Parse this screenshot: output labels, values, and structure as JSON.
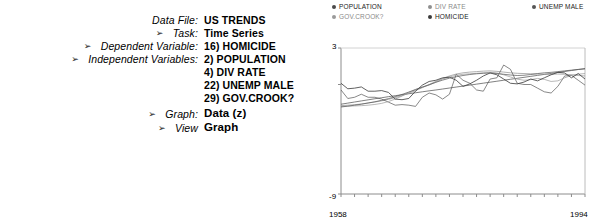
{
  "form": {
    "rows": [
      {
        "arrow": false,
        "label": "Data File:",
        "value": "US TRENDS",
        "big": false
      },
      {
        "arrow": true,
        "label": "Task:",
        "value": "Time Series",
        "big": false
      },
      {
        "arrow": true,
        "label": "Dependent Variable:",
        "value": "16) HOMICIDE",
        "big": false
      },
      {
        "arrow": true,
        "label": "Independent Variables:",
        "value": "2) POPULATION",
        "big": false
      },
      {
        "arrow": false,
        "label": "",
        "value": "4) DIV RATE",
        "big": false
      },
      {
        "arrow": false,
        "label": "",
        "value": "22) UNEMP MALE",
        "big": false
      },
      {
        "arrow": false,
        "label": "",
        "value": "29) GOV.CROOK?",
        "big": false
      },
      {
        "arrow": true,
        "label": "Graph:",
        "value": "Data (z)",
        "big": true
      },
      {
        "arrow": true,
        "label": "View",
        "value": "Graph",
        "big": true
      }
    ],
    "arrow_glyph": "➢"
  },
  "chart_data": {
    "type": "line",
    "title": "",
    "xlabel": "",
    "ylabel": "",
    "xlim": [
      1958,
      1994
    ],
    "ylim": [
      -9,
      3
    ],
    "ytick_labels": [
      "3",
      "-9"
    ],
    "xtick_labels": [
      "1958",
      "1994"
    ],
    "grid": false,
    "legend_position": "top",
    "legend": [
      {
        "name": "POPULATION",
        "color": "#4a4a4a",
        "col": 0,
        "row": 0
      },
      {
        "name": "GOV.CROOK?",
        "color": "#9a9a9a",
        "col": 0,
        "row": 1
      },
      {
        "name": "DIV RATE",
        "color": "#8f8f8f",
        "col": 1,
        "row": 0
      },
      {
        "name": "HOMICIDE",
        "color": "#3a3a3a",
        "col": 1,
        "row": 1
      },
      {
        "name": "UNEMP MALE",
        "color": "#555555",
        "col": 2,
        "row": 0
      }
    ],
    "x": [
      1958,
      1959,
      1960,
      1961,
      1962,
      1963,
      1964,
      1965,
      1966,
      1967,
      1968,
      1969,
      1970,
      1971,
      1972,
      1973,
      1974,
      1975,
      1976,
      1977,
      1978,
      1979,
      1980,
      1981,
      1982,
      1983,
      1984,
      1985,
      1986,
      1987,
      1988,
      1989,
      1990,
      1991,
      1992,
      1993,
      1994
    ],
    "series": [
      {
        "name": "POPULATION",
        "color": "#4a4a4a",
        "width": 0.7,
        "values": [
          -1.62,
          -1.53,
          -1.44,
          -1.35,
          -1.26,
          -1.17,
          -1.09,
          -1.0,
          -0.92,
          -0.84,
          -0.76,
          -0.68,
          -0.6,
          -0.52,
          -0.45,
          -0.37,
          -0.29,
          -0.21,
          -0.13,
          -0.05,
          0.03,
          0.11,
          0.19,
          0.27,
          0.35,
          0.43,
          0.51,
          0.59,
          0.67,
          0.75,
          0.83,
          0.91,
          0.99,
          1.07,
          1.15,
          1.23,
          1.31
        ]
      },
      {
        "name": "DIV RATE",
        "color": "#8f8f8f",
        "width": 0.7,
        "values": [
          -1.74,
          -1.7,
          -1.66,
          -1.6,
          -1.52,
          -1.44,
          -1.34,
          -1.22,
          -1.08,
          -0.92,
          -0.72,
          -0.5,
          -0.26,
          0.0,
          0.26,
          0.5,
          0.7,
          0.86,
          0.96,
          1.02,
          1.06,
          1.1,
          1.12,
          1.08,
          1.02,
          0.96,
          0.92,
          0.9,
          0.88,
          0.86,
          0.84,
          0.84,
          0.86,
          0.84,
          0.8,
          0.74,
          0.7
        ]
      },
      {
        "name": "UNEMP MALE",
        "color": "#555555",
        "width": 0.7,
        "values": [
          -0.45,
          -1.15,
          -1.05,
          -0.8,
          -1.05,
          -1.05,
          -1.2,
          -1.45,
          -1.7,
          -1.65,
          -1.7,
          -1.8,
          -1.05,
          -0.7,
          -0.85,
          -1.2,
          -0.8,
          0.85,
          0.35,
          0.1,
          -0.45,
          -0.55,
          0.45,
          0.55,
          1.6,
          1.25,
          0.1,
          0.0,
          0.0,
          -0.3,
          -0.6,
          -0.7,
          -0.15,
          0.7,
          0.75,
          0.35,
          -0.05
        ]
      },
      {
        "name": "GOV.CROOK?",
        "color": "#9a9a9a",
        "width": 0.7,
        "values": [
          -1.8,
          -1.78,
          -1.76,
          -1.74,
          -1.7,
          -1.64,
          -1.55,
          -1.4,
          -1.2,
          -0.95,
          -0.66,
          -0.4,
          -0.2,
          -0.05,
          0.2,
          0.45,
          0.62,
          0.76,
          0.84,
          0.88,
          0.92,
          0.96,
          1.0,
          0.95,
          0.8,
          0.62,
          0.44,
          0.35,
          0.4,
          0.5,
          0.42,
          0.25,
          0.3,
          0.55,
          0.75,
          0.85,
          0.9
        ]
      },
      {
        "name": "HOMICIDE",
        "color": "#3a3a3a",
        "width": 0.8,
        "values": [
          0.1,
          -0.35,
          -0.3,
          -0.2,
          -0.55,
          -0.55,
          -0.5,
          -0.65,
          -1.2,
          -1.25,
          -1.15,
          -0.55,
          -0.05,
          0.25,
          0.35,
          0.55,
          0.6,
          0.35,
          -0.15,
          0.05,
          0.35,
          0.7,
          0.95,
          0.8,
          0.45,
          0.1,
          0.05,
          0.2,
          0.45,
          0.3,
          0.55,
          0.8,
          1.0,
          0.95,
          0.55,
          0.9,
          0.45
        ]
      },
      {
        "name": "HOMICIDE-TREND",
        "color": "#555555",
        "width": 0.7,
        "values": [
          -1.85,
          -1.78,
          -1.7,
          -1.62,
          -1.52,
          -1.42,
          -1.3,
          -1.16,
          -1.0,
          -0.82,
          -0.62,
          -0.42,
          -0.22,
          -0.02,
          0.18,
          0.36,
          0.52,
          0.64,
          0.74,
          0.82,
          0.88,
          0.92,
          0.94,
          0.9,
          0.84,
          0.78,
          0.74,
          0.76,
          0.82,
          0.9,
          0.96,
          1.0,
          1.06,
          1.12,
          1.18,
          1.24,
          1.28
        ]
      }
    ]
  }
}
